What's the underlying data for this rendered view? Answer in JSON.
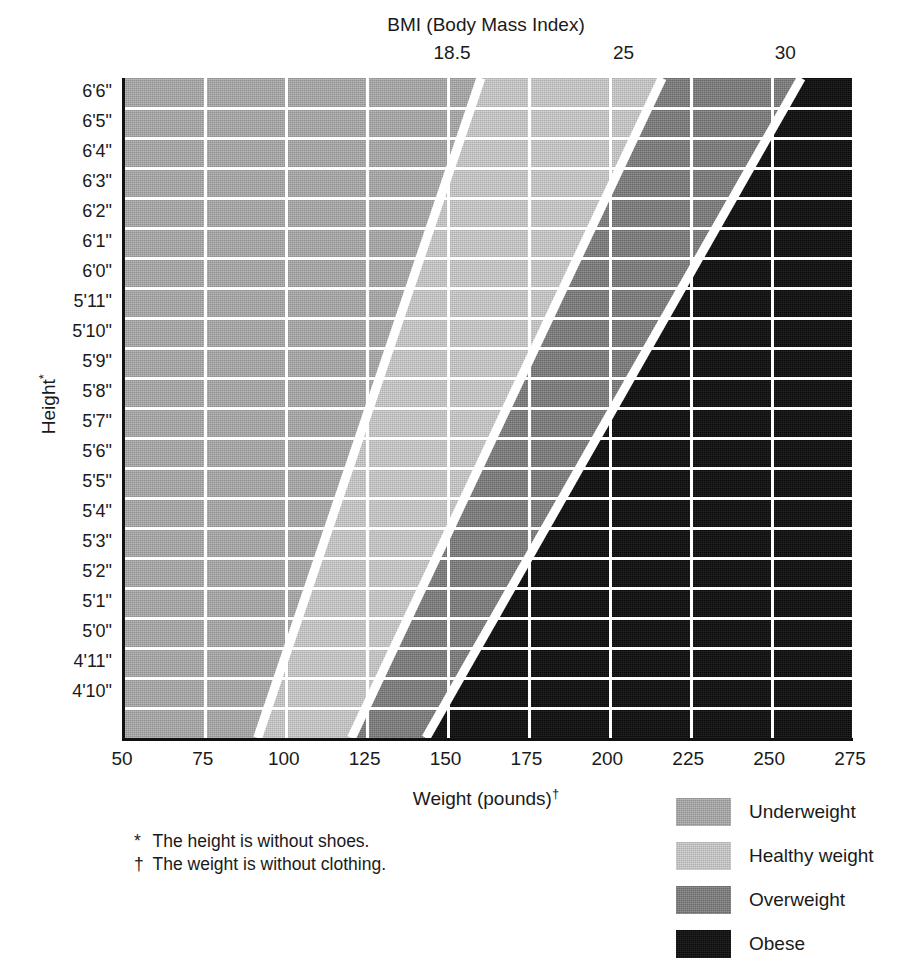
{
  "chart_data": {
    "type": "heatmap",
    "title": "BMI (Body Mass Index)",
    "xlabel": "Weight (pounds)",
    "ylabel": "Height",
    "xlabel_footnote_mark": "†",
    "ylabel_footnote_mark": "*",
    "xlim": [
      50,
      275
    ],
    "ylim_heights_in": [
      58,
      78
    ],
    "grid": true,
    "legend_position": "bottom-right",
    "x_ticks": [
      {
        "label": "50",
        "value": 50
      },
      {
        "label": "75",
        "value": 75
      },
      {
        "label": "100",
        "value": 100
      },
      {
        "label": "125",
        "value": 125
      },
      {
        "label": "150",
        "value": 150
      },
      {
        "label": "175",
        "value": 175
      },
      {
        "label": "200",
        "value": 200
      },
      {
        "label": "225",
        "value": 225
      },
      {
        "label": "250",
        "value": 250
      },
      {
        "label": "275",
        "value": 275
      }
    ],
    "y_ticks": [
      {
        "label": "6'6\"",
        "inches": 78
      },
      {
        "label": "6'5\"",
        "inches": 77
      },
      {
        "label": "6'4\"",
        "inches": 76
      },
      {
        "label": "6'3\"",
        "inches": 75
      },
      {
        "label": "6'2\"",
        "inches": 74
      },
      {
        "label": "6'1\"",
        "inches": 73
      },
      {
        "label": "6'0\"",
        "inches": 72
      },
      {
        "label": "5'11\"",
        "inches": 71
      },
      {
        "label": "5'10\"",
        "inches": 70
      },
      {
        "label": "5'9\"",
        "inches": 69
      },
      {
        "label": "5'8\"",
        "inches": 68
      },
      {
        "label": "5'7\"",
        "inches": 67
      },
      {
        "label": "5'6\"",
        "inches": 66
      },
      {
        "label": "5'5\"",
        "inches": 65
      },
      {
        "label": "5'4\"",
        "inches": 64
      },
      {
        "label": "5'3\"",
        "inches": 63
      },
      {
        "label": "5'2\"",
        "inches": 62
      },
      {
        "label": "5'1\"",
        "inches": 61
      },
      {
        "label": "5'0\"",
        "inches": 60
      },
      {
        "label": "4'11\"",
        "inches": 59
      },
      {
        "label": "4'10\"",
        "inches": 58
      }
    ],
    "bmi_ticks": [
      {
        "label": "18.5",
        "value": 18.5,
        "weight_at_top_height": 152
      },
      {
        "label": "25",
        "value": 25,
        "weight_at_top_height": 205
      },
      {
        "label": "30",
        "value": 30,
        "weight_at_top_height": 255
      }
    ],
    "bmi_boundaries": [
      {
        "bmi": 18.5,
        "weight_at_4ft10": 91,
        "weight_at_6ft6": 160
      },
      {
        "bmi": 25,
        "weight_at_4ft10": 120,
        "weight_at_6ft6": 216
      },
      {
        "bmi": 30,
        "weight_at_4ft10": 143,
        "weight_at_6ft6": 259
      }
    ],
    "categories": [
      {
        "name": "Underweight",
        "bmi_range": "< 18.5",
        "color": "#a9a9a9"
      },
      {
        "name": "Healthy weight",
        "bmi_range": "18.5 - 25",
        "color": "#cbcbcb"
      },
      {
        "name": "Overweight",
        "bmi_range": "25 - 30",
        "color": "#7a7a7a"
      },
      {
        "name": "Obese",
        "bmi_range": "30+",
        "color": "#0d0d0d"
      }
    ]
  },
  "header": {
    "title": "BMI (Body Mass Index)"
  },
  "axes": {
    "x_title": "Weight (pounds)",
    "x_title_mark": "†",
    "y_title": "Height",
    "y_title_mark": "*"
  },
  "legend": {
    "items": [
      {
        "label": "Underweight",
        "color": "#a9a9a9"
      },
      {
        "label": "Healthy weight",
        "color": "#cbcbcb"
      },
      {
        "label": "Overweight",
        "color": "#7a7a7a"
      },
      {
        "label": "Obese",
        "color": "#0d0d0d"
      }
    ]
  },
  "footnotes": [
    {
      "mark": "*",
      "text": "The height is without shoes."
    },
    {
      "mark": "†",
      "text": "The weight is without clothing."
    }
  ]
}
